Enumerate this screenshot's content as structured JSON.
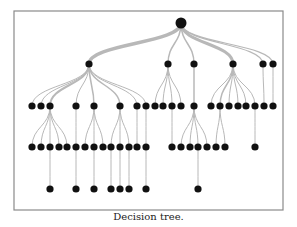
{
  "caption": "Decision tree.",
  "colors": {
    "node": "#111111",
    "edge": "#b8b8b8",
    "frame": "#8a8a8a",
    "background": "#ffffff"
  },
  "frame": {
    "x": 14,
    "y": 11,
    "width": 269,
    "height": 199
  },
  "tree": {
    "root": {
      "id": "r",
      "x": 181,
      "y": 23,
      "r": 5.5
    },
    "levels_y": [
      23,
      64,
      106,
      147,
      189
    ],
    "nodes": [
      {
        "id": "a",
        "x": 89,
        "y": 64,
        "parent": "r",
        "w": 3.5
      },
      {
        "id": "b",
        "x": 168,
        "y": 64,
        "parent": "r",
        "w": 1.5
      },
      {
        "id": "c",
        "x": 194,
        "y": 64,
        "parent": "r",
        "w": 1.5
      },
      {
        "id": "d",
        "x": 233,
        "y": 64,
        "parent": "r",
        "w": 3
      },
      {
        "id": "e",
        "x": 263,
        "y": 64,
        "parent": "r",
        "w": 1.2
      },
      {
        "id": "f",
        "x": 273,
        "y": 64,
        "parent": "r",
        "w": 1.2
      },
      {
        "id": "a1",
        "x": 32,
        "y": 106,
        "parent": "a",
        "w": 1
      },
      {
        "id": "a2",
        "x": 41,
        "y": 106,
        "parent": "a",
        "w": 1
      },
      {
        "id": "a3",
        "x": 50,
        "y": 106,
        "parent": "a",
        "w": 2
      },
      {
        "id": "a4",
        "x": 76,
        "y": 106,
        "parent": "a",
        "w": 1
      },
      {
        "id": "a5",
        "x": 94,
        "y": 106,
        "parent": "a",
        "w": 1.5
      },
      {
        "id": "a6",
        "x": 120,
        "y": 106,
        "parent": "a",
        "w": 1.5
      },
      {
        "id": "a7",
        "x": 137,
        "y": 106,
        "parent": "a",
        "w": 1
      },
      {
        "id": "a8",
        "x": 146,
        "y": 106,
        "parent": "a",
        "w": 1
      },
      {
        "id": "b1",
        "x": 155,
        "y": 106,
        "parent": "b",
        "w": 1
      },
      {
        "id": "b2",
        "x": 163,
        "y": 106,
        "parent": "b",
        "w": 1
      },
      {
        "id": "b3",
        "x": 172,
        "y": 106,
        "parent": "b",
        "w": 1
      },
      {
        "id": "b4",
        "x": 181,
        "y": 106,
        "parent": "b",
        "w": 1
      },
      {
        "id": "c1",
        "x": 194,
        "y": 106,
        "parent": "c",
        "w": 1.5
      },
      {
        "id": "d1",
        "x": 211,
        "y": 106,
        "parent": "d",
        "w": 1
      },
      {
        "id": "d2",
        "x": 220,
        "y": 106,
        "parent": "d",
        "w": 1.5
      },
      {
        "id": "d3",
        "x": 229,
        "y": 106,
        "parent": "d",
        "w": 1
      },
      {
        "id": "d4",
        "x": 238,
        "y": 106,
        "parent": "d",
        "w": 1
      },
      {
        "id": "d5",
        "x": 246,
        "y": 106,
        "parent": "d",
        "w": 1
      },
      {
        "id": "d6",
        "x": 255,
        "y": 106,
        "parent": "d",
        "w": 1
      },
      {
        "id": "e1",
        "x": 264,
        "y": 106,
        "parent": "e",
        "w": 1
      },
      {
        "id": "f1",
        "x": 273,
        "y": 106,
        "parent": "f",
        "w": 1
      },
      {
        "id": "a3a",
        "x": 32,
        "y": 147,
        "parent": "a3",
        "w": 1
      },
      {
        "id": "a3b",
        "x": 41,
        "y": 147,
        "parent": "a3",
        "w": 1
      },
      {
        "id": "a3c",
        "x": 50,
        "y": 147,
        "parent": "a3",
        "w": 1
      },
      {
        "id": "a3d",
        "x": 59,
        "y": 147,
        "parent": "a3",
        "w": 1
      },
      {
        "id": "a3e",
        "x": 67,
        "y": 147,
        "parent": "a3",
        "w": 1
      },
      {
        "id": "a4a",
        "x": 76,
        "y": 147,
        "parent": "a4",
        "w": 1
      },
      {
        "id": "a5a",
        "x": 85,
        "y": 147,
        "parent": "a5",
        "w": 1
      },
      {
        "id": "a5b",
        "x": 94,
        "y": 147,
        "parent": "a5",
        "w": 1
      },
      {
        "id": "a5c",
        "x": 103,
        "y": 147,
        "parent": "a5",
        "w": 1
      },
      {
        "id": "a6a",
        "x": 111,
        "y": 147,
        "parent": "a6",
        "w": 1
      },
      {
        "id": "a6b",
        "x": 120,
        "y": 147,
        "parent": "a6",
        "w": 1
      },
      {
        "id": "a6c",
        "x": 129,
        "y": 147,
        "parent": "a6",
        "w": 1
      },
      {
        "id": "a7a",
        "x": 137,
        "y": 147,
        "parent": "a7",
        "w": 1
      },
      {
        "id": "a8a",
        "x": 146,
        "y": 147,
        "parent": "a8",
        "w": 1
      },
      {
        "id": "b3a",
        "x": 172,
        "y": 147,
        "parent": "b3",
        "w": 1
      },
      {
        "id": "c1a",
        "x": 181,
        "y": 147,
        "parent": "c1",
        "w": 1
      },
      {
        "id": "c1b",
        "x": 190,
        "y": 147,
        "parent": "c1",
        "w": 1
      },
      {
        "id": "c1c",
        "x": 198,
        "y": 147,
        "parent": "c1",
        "w": 1
      },
      {
        "id": "c1d",
        "x": 207,
        "y": 147,
        "parent": "c1",
        "w": 1
      },
      {
        "id": "d2a",
        "x": 216,
        "y": 147,
        "parent": "d2",
        "w": 1
      },
      {
        "id": "d2b",
        "x": 225,
        "y": 147,
        "parent": "d2",
        "w": 1
      },
      {
        "id": "d6a",
        "x": 255,
        "y": 147,
        "parent": "d6",
        "w": 1
      },
      {
        "id": "x1",
        "x": 50,
        "y": 189,
        "parent": "a3c",
        "w": 1
      },
      {
        "id": "x2",
        "x": 76,
        "y": 189,
        "parent": "a4a",
        "w": 1
      },
      {
        "id": "x3",
        "x": 94,
        "y": 189,
        "parent": "a5b",
        "w": 1
      },
      {
        "id": "x4",
        "x": 111,
        "y": 189,
        "parent": "a6a",
        "w": 1
      },
      {
        "id": "x5",
        "x": 120,
        "y": 189,
        "parent": "a6b",
        "w": 1
      },
      {
        "id": "x6",
        "x": 129,
        "y": 189,
        "parent": "a6c",
        "w": 1
      },
      {
        "id": "x7",
        "x": 146,
        "y": 189,
        "parent": "a8a",
        "w": 1
      },
      {
        "id": "x8",
        "x": 198,
        "y": 189,
        "parent": "c1c",
        "w": 1
      }
    ],
    "node_radius": 3.6
  }
}
